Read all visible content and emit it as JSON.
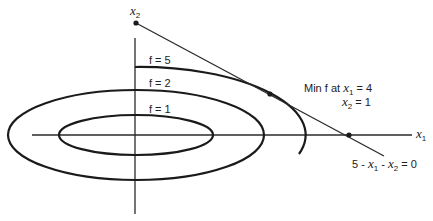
{
  "diagram": {
    "axes": {
      "x_label": "x",
      "x_label_sub": "1",
      "y_label": "x",
      "y_label_sub": "2"
    },
    "contours": [
      {
        "label": "f = 1"
      },
      {
        "label": "f = 2"
      },
      {
        "label": "f = 5"
      }
    ],
    "constraint": {
      "label_prefix": "5 - ",
      "label_x1": "x",
      "label_x1_sub": "1",
      "label_mid": " - ",
      "label_x2": "x",
      "label_x2_sub": "2",
      "label_suffix": " = 0"
    },
    "annotation": {
      "line1_prefix": "Min f at ",
      "line1_var": "x",
      "line1_sub": "1",
      "line1_value": " = 4",
      "line2_var": "x",
      "line2_sub": "2",
      "line2_value": " = 1"
    },
    "optimum": {
      "x1": 4,
      "x2": 1
    }
  }
}
